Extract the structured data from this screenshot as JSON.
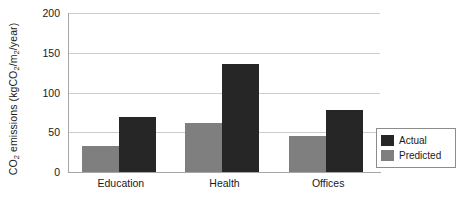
{
  "chart_data": {
    "type": "bar",
    "title": "",
    "xlabel": "",
    "ylabel": "CO2 emissions (kgCO2/m2/year)",
    "ylabel_parts": {
      "pre": "CO",
      "sub1": "2",
      "mid": " emissions (kgCO",
      "sub2": "2",
      "mid2": "/m",
      "sub3": "2",
      "post": "/year)"
    },
    "categories": [
      "Education",
      "Health",
      "Offices"
    ],
    "series": [
      {
        "name": "Actual",
        "color": "#262626",
        "values": [
          69,
          136,
          78
        ]
      },
      {
        "name": "Predicted",
        "color": "#7f7f7f",
        "values": [
          33,
          62,
          45
        ]
      }
    ],
    "ylim": [
      0,
      200
    ],
    "yticks": [
      0,
      50,
      100,
      150,
      200
    ],
    "ytick_labels": [
      "0",
      "50",
      "100",
      "150",
      "200"
    ],
    "grid": "horizontal",
    "legend_position": "right-bottom-inside",
    "legend_entries": [
      {
        "label": "Actual",
        "color": "#262626"
      },
      {
        "label": "Predicted",
        "color": "#7f7f7f"
      }
    ],
    "axis_color": "#a6a6a6",
    "gridline_color": "#cccccc"
  }
}
